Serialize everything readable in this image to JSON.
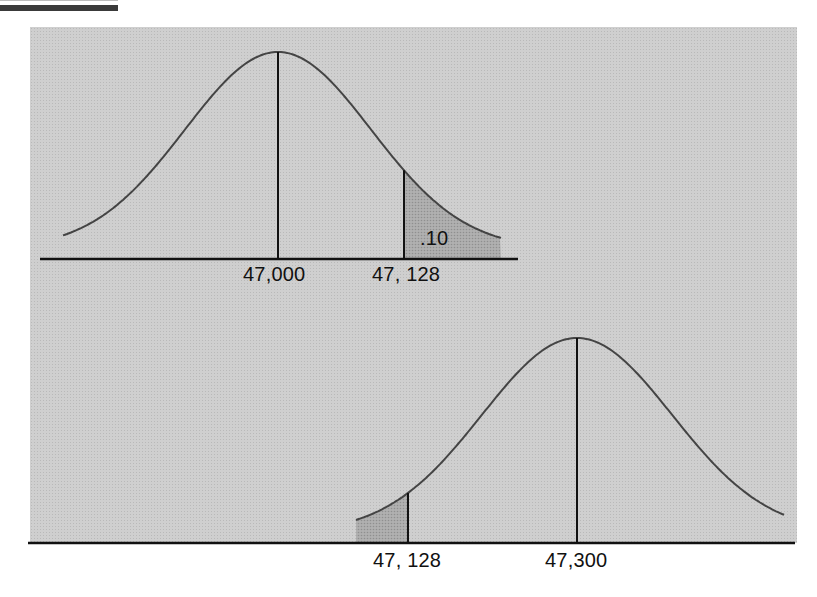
{
  "chart_data": [
    {
      "type": "area",
      "title": "",
      "description": "Normal distribution centered at 47,000 with shaded upper tail beyond 47,128",
      "x_tick_labels": [
        "47,000",
        "47, 128"
      ],
      "mean": 47000,
      "critical_value": 47128,
      "shaded_region": "right tail",
      "shaded_area_label": ".10",
      "shaded_area": 0.1,
      "grid": false,
      "legend": null
    },
    {
      "type": "area",
      "title": "",
      "description": "Normal distribution centered at 47,300 with shaded lower tail below 47,128",
      "x_tick_labels": [
        "47, 128",
        "47,300"
      ],
      "mean": 47300,
      "critical_value": 47128,
      "shaded_region": "left tail",
      "shaded_area_label": "",
      "grid": false,
      "legend": null
    }
  ],
  "top": {
    "mean_label": "47,000",
    "critical_label": "47, 128",
    "area_label": ".10"
  },
  "bottom": {
    "critical_label": "47, 128",
    "mean_label": "47,300"
  },
  "colors": {
    "panel": "#cfcfcf",
    "shade": "#a9a9a9",
    "line": "#111111",
    "curve": "#444444"
  }
}
